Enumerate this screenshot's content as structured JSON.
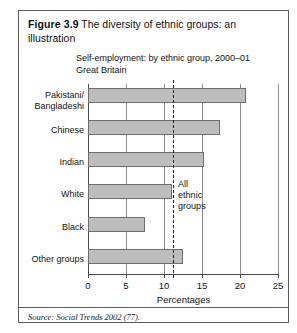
{
  "figure": {
    "label": "Figure 3.9",
    "title": "The diversity of ethnic groups: an illustration",
    "source_prefix": "Source:",
    "source_text": "Social Trends 2002 (77)."
  },
  "chart_data": {
    "type": "bar",
    "orientation": "horizontal",
    "title": "Self-employment: by ethnic group, 2000–01",
    "subtitle": "Great Britain",
    "categories": [
      "Pakistani/\nBangladeshi",
      "Chinese",
      "Indian",
      "White",
      "Black",
      "Other groups"
    ],
    "values": [
      20.8,
      17.4,
      15.3,
      11.1,
      7.5,
      12.5
    ],
    "xlabel": "Percentages",
    "ylabel": "",
    "xlim": [
      0,
      25
    ],
    "xticks": [
      0,
      5,
      10,
      15,
      20,
      25
    ],
    "xtick_labels": [
      "0",
      "5",
      "10",
      "15",
      "20",
      "25"
    ],
    "grid": "vertical",
    "legend": "none",
    "bar_color": "#bdbdbd",
    "bar_border_color": "#6e6e6e",
    "annotations": [
      {
        "name": "all-ethnic-groups-reference",
        "text": "All\nethnic\ngroups",
        "value": 11.2,
        "style": "dashed-vertical-line"
      }
    ]
  }
}
